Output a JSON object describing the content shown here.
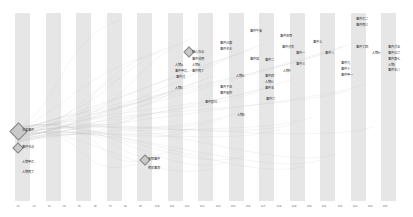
{
  "diagram": {
    "type": "storyline-timeline",
    "bands": [
      15,
      46,
      76,
      107,
      137,
      168,
      198,
      229,
      259,
      290,
      320,
      351,
      381
    ],
    "ticks": [
      {
        "x": 17,
        "label": "t1"
      },
      {
        "x": 33,
        "label": "t2"
      },
      {
        "x": 48,
        "label": "t3"
      },
      {
        "x": 63,
        "label": "t4"
      },
      {
        "x": 78,
        "label": "t5"
      },
      {
        "x": 94,
        "label": "t6"
      },
      {
        "x": 109,
        "label": "t7"
      },
      {
        "x": 124,
        "label": "t8"
      },
      {
        "x": 139,
        "label": "t9"
      },
      {
        "x": 155,
        "label": "t10"
      },
      {
        "x": 170,
        "label": "t11"
      },
      {
        "x": 185,
        "label": "t12"
      },
      {
        "x": 200,
        "label": "t13"
      },
      {
        "x": 216,
        "label": "t14"
      },
      {
        "x": 231,
        "label": "t15"
      },
      {
        "x": 246,
        "label": "t16"
      },
      {
        "x": 261,
        "label": "t17"
      },
      {
        "x": 277,
        "label": "t18"
      },
      {
        "x": 292,
        "label": "t19"
      },
      {
        "x": 307,
        "label": "t20"
      },
      {
        "x": 322,
        "label": "t21"
      },
      {
        "x": 338,
        "label": "t22"
      },
      {
        "x": 353,
        "label": "t23"
      },
      {
        "x": 368,
        "label": "t24"
      },
      {
        "x": 383,
        "label": "t25"
      }
    ],
    "nodes": [
      {
        "x": 12,
        "y": 125,
        "size": 11,
        "label": "主要事件",
        "lx": 22,
        "ly": 128
      },
      {
        "x": 14,
        "y": 144,
        "size": 6,
        "label": "事件节点",
        "lx": 22,
        "ly": 145
      },
      {
        "x": 141,
        "y": 156,
        "size": 6,
        "label": "关联事件",
        "lx": 148,
        "ly": 157
      },
      {
        "x": 185,
        "y": 48,
        "size": 6,
        "label": "核心节点",
        "lx": 192,
        "ly": 50
      }
    ],
    "labels": [
      {
        "x": 22,
        "y": 160,
        "text": "人物甲乙"
      },
      {
        "x": 22,
        "y": 170,
        "text": "人物丙丁"
      },
      {
        "x": 148,
        "y": 166,
        "text": "相关事项"
      },
      {
        "x": 192,
        "y": 57,
        "text": "事件说明"
      },
      {
        "x": 175,
        "y": 63,
        "text": "人物A"
      },
      {
        "x": 192,
        "y": 63,
        "text": "人物B"
      },
      {
        "x": 175,
        "y": 69,
        "text": "事件甲乙"
      },
      {
        "x": 192,
        "y": 69,
        "text": "事件丙丁"
      },
      {
        "x": 176,
        "y": 75,
        "text": "事件戊"
      },
      {
        "x": 175,
        "y": 86,
        "text": "人物C"
      },
      {
        "x": 220,
        "y": 41,
        "text": "事件己庚"
      },
      {
        "x": 220,
        "y": 47,
        "text": "事件辛壬"
      },
      {
        "x": 250,
        "y": 57,
        "text": "事件癸"
      },
      {
        "x": 236,
        "y": 74,
        "text": "人物D"
      },
      {
        "x": 220,
        "y": 85,
        "text": "事件子丑"
      },
      {
        "x": 220,
        "y": 91,
        "text": "事件寅卯"
      },
      {
        "x": 205,
        "y": 100,
        "text": "事件辰巳"
      },
      {
        "x": 237,
        "y": 113,
        "text": "人物E"
      },
      {
        "x": 250,
        "y": 29,
        "text": "事件午未"
      },
      {
        "x": 280,
        "y": 34,
        "text": "事件申酉"
      },
      {
        "x": 282,
        "y": 45,
        "text": "事件戌亥"
      },
      {
        "x": 296,
        "y": 51,
        "text": "事件一"
      },
      {
        "x": 265,
        "y": 58,
        "text": "事件二"
      },
      {
        "x": 296,
        "y": 62,
        "text": "事件三"
      },
      {
        "x": 283,
        "y": 69,
        "text": "人物F"
      },
      {
        "x": 265,
        "y": 74,
        "text": "事件四"
      },
      {
        "x": 265,
        "y": 80,
        "text": "人物G"
      },
      {
        "x": 265,
        "y": 86,
        "text": "事件五"
      },
      {
        "x": 266,
        "y": 97,
        "text": "事件六"
      },
      {
        "x": 313,
        "y": 40,
        "text": "事件七"
      },
      {
        "x": 325,
        "y": 51,
        "text": "事件八"
      },
      {
        "x": 341,
        "y": 61,
        "text": "事件九"
      },
      {
        "x": 341,
        "y": 67,
        "text": "事件十"
      },
      {
        "x": 341,
        "y": 73,
        "text": "事件甲一"
      },
      {
        "x": 356,
        "y": 17,
        "text": "事件乙二"
      },
      {
        "x": 356,
        "y": 23,
        "text": "事件丙三"
      },
      {
        "x": 356,
        "y": 45,
        "text": "事件丁四"
      },
      {
        "x": 372,
        "y": 51,
        "text": "人物H"
      },
      {
        "x": 388,
        "y": 45,
        "text": "事件戊五"
      },
      {
        "x": 388,
        "y": 51,
        "text": "事件己六"
      },
      {
        "x": 388,
        "y": 57,
        "text": "事件庚七"
      },
      {
        "x": 388,
        "y": 63,
        "text": "人物I"
      },
      {
        "x": 388,
        "y": 68,
        "text": "事件辛八"
      }
    ]
  }
}
